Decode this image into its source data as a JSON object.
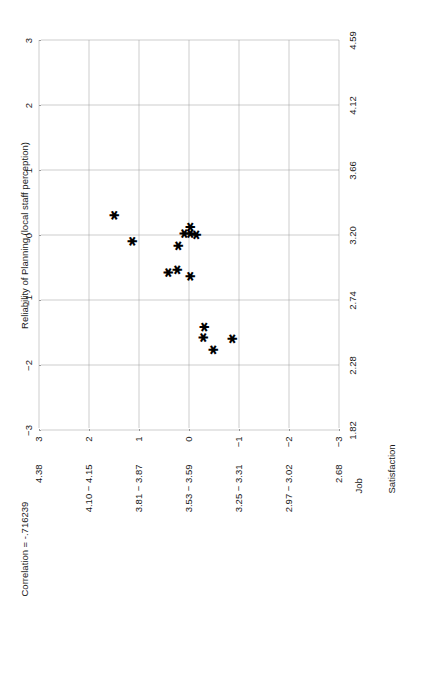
{
  "figure": {
    "orientation": "rotated-90-ccw",
    "background": "#ffffff",
    "ink_color": "#1a1a1a",
    "grid_color": "#9a9a9a"
  },
  "axis_titles": {
    "y_line1": "Job",
    "y_line2": "Satisfaction",
    "x_title": "Reliability of Planning (local staff perception)"
  },
  "annotation": {
    "correlation_text": "Correlation = -.716239"
  },
  "y_tick_labels": [
    "4.38",
    "4.10 − 4.15",
    "3.81 − 3.87",
    "3.53 − 3.59",
    "3.25 − 3.31",
    "2.97 − 3.02",
    "2.68"
  ],
  "x_tick_labels": [
    "1.82",
    "2.28",
    "2.74",
    "3.20",
    "3.66",
    "4.12",
    "4.59"
  ],
  "z_top_labels": [
    "3",
    "2",
    "1",
    "0",
    "−1",
    "−2",
    "−3"
  ],
  "z_left_labels": [
    "3",
    "2",
    "1",
    "0",
    "−1",
    "−2",
    "−3"
  ],
  "chart_data": {
    "type": "scatter",
    "title": "",
    "xlabel": "Reliability of Planning (local staff perception)",
    "ylabel": "Job Satisfaction",
    "xlim": [
      1.82,
      4.59
    ],
    "ylim": [
      2.68,
      4.38
    ],
    "x_ticks": [
      1.82,
      2.28,
      2.74,
      3.2,
      3.66,
      4.12,
      4.59
    ],
    "y_ticks": [
      4.38,
      4.125,
      3.84,
      3.56,
      3.28,
      2.995,
      2.68
    ],
    "x_tick_labels": [
      "1.82",
      "2.28",
      "2.74",
      "3.20",
      "3.66",
      "4.12",
      "4.59"
    ],
    "y_tick_labels": [
      "4.38",
      "4.10 − 4.15",
      "3.81 − 3.87",
      "3.53 − 3.59",
      "3.25 − 3.31",
      "2.97 − 3.02",
      "2.68"
    ],
    "secondary_x_axis": {
      "label": "z",
      "ticks": [
        -3,
        -2,
        -1,
        0,
        1,
        2,
        3
      ],
      "tick_labels": [
        "−3",
        "−2",
        "−1",
        "0",
        "1",
        "2",
        "3"
      ]
    },
    "secondary_y_axis": {
      "label": "z",
      "ticks": [
        -3,
        -2,
        -1,
        0,
        1,
        2,
        3
      ],
      "tick_labels": [
        "−3",
        "−2",
        "−1",
        "0",
        "1",
        "2",
        "3"
      ]
    },
    "grid": true,
    "legend": false,
    "marker": "asterisk",
    "marker_glyph": "✱",
    "marker_color": "#000000",
    "correlation": -0.716239,
    "n_points": 14,
    "points": [
      {
        "x": 3.33,
        "y": 4.06,
        "zx": 0.3,
        "zy": 1.5
      },
      {
        "x": 3.14,
        "y": 4.13,
        "zx": -0.1,
        "zy": 1.13
      },
      {
        "x": 2.37,
        "y": 3.91,
        "zx": -0.58,
        "zy": 0.41
      },
      {
        "x": 2.5,
        "y": 3.86,
        "zx": -0.54,
        "zy": 0.24
      },
      {
        "x": 2.79,
        "y": 3.79,
        "zx": -0.17,
        "zy": 0.22
      },
      {
        "x": 3.22,
        "y": 3.64,
        "zx": 0.02,
        "zy": 0.09
      },
      {
        "x": 3.27,
        "y": 3.62,
        "zx": 0.02,
        "zy": -0.02
      },
      {
        "x": 3.3,
        "y": 3.57,
        "zx": 0.12,
        "zy": -0.02
      },
      {
        "x": 3.31,
        "y": 3.55,
        "zx": 0.0,
        "zy": -0.14
      },
      {
        "x": 3.0,
        "y": 3.49,
        "zx": -0.64,
        "zy": -0.02
      },
      {
        "x": 2.98,
        "y": 3.22,
        "zx": -1.42,
        "zy": -0.3
      },
      {
        "x": 2.91,
        "y": 3.16,
        "zx": -1.58,
        "zy": -0.28
      },
      {
        "x": 2.66,
        "y": 3.09,
        "zx": -1.77,
        "zy": -0.49
      },
      {
        "x": 2.52,
        "y": 3.0,
        "zx": -1.6,
        "zy": -0.87
      }
    ]
  }
}
